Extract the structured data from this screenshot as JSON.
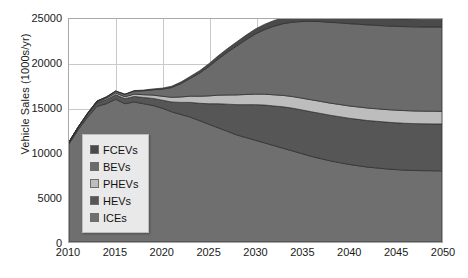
{
  "chart_data": {
    "type": "area",
    "stacked": true,
    "title": "",
    "xlabel": "",
    "ylabel": "Vehicle Sales (1000s/yr)",
    "xlim": [
      2010,
      2050
    ],
    "ylim": [
      0,
      25000
    ],
    "xticks": [
      "2010",
      "2015",
      "2020",
      "2025",
      "2030",
      "2035",
      "2040",
      "2045",
      "2050"
    ],
    "yticks": [
      "0",
      "5000",
      "10000",
      "15000",
      "20000",
      "25000"
    ],
    "grid": true,
    "legend_position": "inside-left",
    "x": [
      2010,
      2011,
      2012,
      2013,
      2014,
      2015,
      2016,
      2017,
      2018,
      2019,
      2020,
      2021,
      2022,
      2023,
      2024,
      2025,
      2026,
      2027,
      2028,
      2029,
      2030,
      2031,
      2032,
      2033,
      2034,
      2035,
      2036,
      2037,
      2038,
      2039,
      2040,
      2041,
      2042,
      2043,
      2044,
      2045,
      2046,
      2047,
      2048,
      2049,
      2050
    ],
    "series": [
      {
        "name": "ICEs",
        "color": "#6f6f6f",
        "values": [
          11000,
          12600,
          14000,
          15200,
          15500,
          16000,
          15500,
          15700,
          15500,
          15300,
          15000,
          14600,
          14300,
          14000,
          13600,
          13200,
          12800,
          12400,
          12000,
          11700,
          11400,
          11100,
          10800,
          10500,
          10200,
          9900,
          9600,
          9350,
          9100,
          8900,
          8700,
          8550,
          8400,
          8300,
          8200,
          8120,
          8060,
          8020,
          8000,
          7990,
          7980
        ]
      },
      {
        "name": "HEVs",
        "color": "#565656",
        "values": [
          200,
          260,
          330,
          400,
          460,
          520,
          560,
          620,
          700,
          800,
          900,
          1100,
          1350,
          1650,
          1950,
          2300,
          2700,
          3050,
          3400,
          3700,
          4000,
          4250,
          4450,
          4650,
          4800,
          4900,
          5000,
          5060,
          5110,
          5150,
          5180,
          5200,
          5220,
          5230,
          5240,
          5250,
          5250,
          5250,
          5250,
          5250,
          5250
        ]
      },
      {
        "name": "PHEVs",
        "color": "#bdbdbd",
        "values": [
          20,
          40,
          70,
          110,
          150,
          190,
          220,
          260,
          310,
          370,
          440,
          520,
          610,
          700,
          790,
          880,
          960,
          1030,
          1090,
          1140,
          1180,
          1220,
          1250,
          1280,
          1300,
          1320,
          1340,
          1350,
          1360,
          1370,
          1380,
          1390,
          1400,
          1405,
          1410,
          1415,
          1420,
          1420,
          1420,
          1420,
          1420
        ]
      },
      {
        "name": "BEVs",
        "color": "#6b6b6b",
        "values": [
          10,
          25,
          50,
          90,
          140,
          200,
          260,
          340,
          450,
          600,
          800,
          1100,
          1500,
          2000,
          2600,
          3300,
          4050,
          4800,
          5500,
          6150,
          6750,
          7250,
          7700,
          8050,
          8350,
          8600,
          8800,
          8950,
          9060,
          9150,
          9220,
          9280,
          9320,
          9350,
          9380,
          9400,
          9420,
          9430,
          9440,
          9450,
          9460
        ]
      },
      {
        "name": "FCEVs",
        "color": "#4a4a4a",
        "values": [
          0,
          0,
          5,
          10,
          20,
          30,
          40,
          55,
          70,
          90,
          110,
          140,
          175,
          215,
          260,
          310,
          360,
          410,
          460,
          510,
          560,
          600,
          640,
          675,
          705,
          730,
          752,
          770,
          785,
          798,
          808,
          816,
          822,
          827,
          831,
          834,
          836,
          838,
          839,
          840,
          840
        ]
      }
    ]
  },
  "legend": {
    "items": [
      {
        "label": "FCEVs",
        "color": "#4a4a4a"
      },
      {
        "label": "BEVs",
        "color": "#6b6b6b"
      },
      {
        "label": "PHEVs",
        "color": "#bdbdbd"
      },
      {
        "label": "HEVs",
        "color": "#565656"
      },
      {
        "label": "ICEs",
        "color": "#6f6f6f"
      }
    ]
  }
}
